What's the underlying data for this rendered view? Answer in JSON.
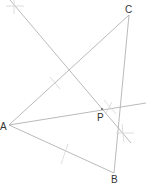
{
  "diagram": {
    "width": 147,
    "height": 183,
    "colors": {
      "line": "#a8a8a8",
      "arc": "#d6d6d6",
      "label": "#333333",
      "background": "#ffffff"
    },
    "points": {
      "A": {
        "label": "A",
        "x": 9,
        "y": 125
      },
      "B": {
        "label": "B",
        "x": 114,
        "y": 173
      },
      "C": {
        "label": "C",
        "x": 129,
        "y": 15
      },
      "P": {
        "label": "P",
        "x": 102,
        "y": 109
      }
    },
    "labels": {
      "A": "A",
      "B": "B",
      "C": "C",
      "P": "P"
    }
  }
}
